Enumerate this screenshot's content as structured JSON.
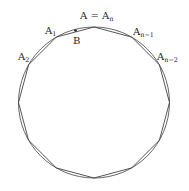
{
  "figure": {
    "type": "circle-with-inscribed-regular-polygon",
    "polygon_sides": 12,
    "circle": {
      "cx": 94,
      "cy": 102.5,
      "r": 75.5
    },
    "stroke_color": "#555555",
    "labels": {
      "top_vertex": {
        "base": "A = A",
        "sub": "n"
      },
      "v1": {
        "base": "A",
        "sub": "1"
      },
      "v2": {
        "base": "A",
        "sub": "2"
      },
      "vn1": {
        "base": "A",
        "sub": "n−1"
      },
      "vn2": {
        "base": "A",
        "sub": "n−2"
      },
      "point_b": "B"
    }
  }
}
